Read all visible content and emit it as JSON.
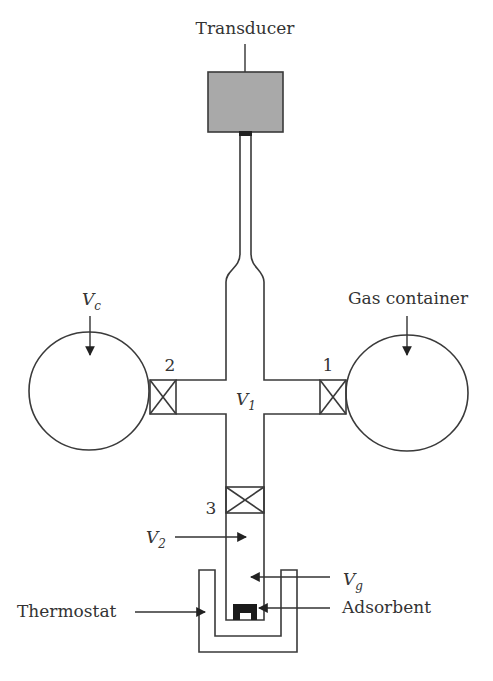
{
  "diagram": {
    "type": "volumetric adsorption apparatus schematic",
    "colors": {
      "line": "#3a3a3a",
      "transducer_fill": "#a9a9a9",
      "adsorbent_fill": "#1a1a1a",
      "text": "#333333"
    },
    "labels": {
      "transducer": "Transducer",
      "gas_container": "Gas container",
      "thermostat": "Thermostat",
      "adsorbent": "Adsorbent",
      "vc_main": "V",
      "vc_sub": "c",
      "v1_main": "V",
      "v1_sub": "1",
      "v2_main": "V",
      "v2_sub": "2",
      "vg_main": "V",
      "vg_sub": "g"
    },
    "valves": [
      {
        "id": "1",
        "label": "1"
      },
      {
        "id": "2",
        "label": "2"
      },
      {
        "id": "3",
        "label": "3"
      }
    ]
  }
}
